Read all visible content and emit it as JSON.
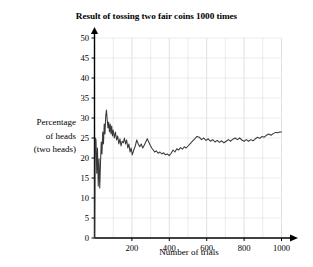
{
  "chart_data": {
    "type": "line",
    "title": "Result of tossing two fair coins 1000 times",
    "xlabel": "Number of trials",
    "ylabel_lines": [
      "Percentage",
      "of heads",
      "(two heads)"
    ],
    "xlim": [
      0,
      1000
    ],
    "ylim": [
      0,
      50
    ],
    "xticks": [
      200,
      400,
      600,
      800,
      1000
    ],
    "yticks": [
      0,
      5,
      10,
      15,
      20,
      25,
      30,
      35,
      40,
      45,
      50
    ],
    "x_minor_step": 100,
    "y_minor_step": 5,
    "grid": true,
    "legend": "none",
    "line_color": "#3a3a3a",
    "grid_color": "#e6e6e6",
    "axis_color": "#000000",
    "series": [
      {
        "name": "Running percentage of two heads",
        "x": [
          1,
          4,
          8,
          12,
          16,
          20,
          24,
          28,
          32,
          36,
          40,
          44,
          48,
          52,
          56,
          60,
          64,
          68,
          72,
          76,
          80,
          84,
          88,
          92,
          96,
          100,
          106,
          112,
          118,
          124,
          130,
          136,
          142,
          148,
          154,
          160,
          166,
          172,
          178,
          184,
          190,
          196,
          202,
          210,
          218,
          226,
          234,
          242,
          250,
          258,
          266,
          274,
          282,
          290,
          298,
          306,
          314,
          322,
          330,
          340,
          350,
          360,
          370,
          380,
          390,
          400,
          410,
          420,
          430,
          440,
          450,
          460,
          470,
          480,
          490,
          500,
          512,
          524,
          536,
          548,
          560,
          572,
          584,
          596,
          608,
          620,
          632,
          644,
          656,
          668,
          680,
          692,
          704,
          716,
          728,
          740,
          752,
          764,
          776,
          788,
          800,
          812,
          824,
          836,
          848,
          860,
          872,
          884,
          896,
          908,
          920,
          932,
          944,
          956,
          968,
          980,
          990,
          1000
        ],
        "y": [
          0,
          25.0,
          24.6,
          16.2,
          22.5,
          13.0,
          19.8,
          12.5,
          18.5,
          24.0,
          21.0,
          26.5,
          23.5,
          28.5,
          26.0,
          30.5,
          32.0,
          29.5,
          27.5,
          29.0,
          26.5,
          28.5,
          26.0,
          28.0,
          25.5,
          27.0,
          25.0,
          26.5,
          24.5,
          25.5,
          23.5,
          24.8,
          23.0,
          24.2,
          23.8,
          25.0,
          23.5,
          24.5,
          22.5,
          23.5,
          21.5,
          22.5,
          20.8,
          22.0,
          23.0,
          24.5,
          23.5,
          22.8,
          23.5,
          22.5,
          23.2,
          24.0,
          24.8,
          24.0,
          23.2,
          22.5,
          22.0,
          21.5,
          21.8,
          21.2,
          21.5,
          21.0,
          21.3,
          20.8,
          21.0,
          20.6,
          21.2,
          22.0,
          21.5,
          22.3,
          22.0,
          22.6,
          22.2,
          22.8,
          22.5,
          23.0,
          23.6,
          24.2,
          24.8,
          25.4,
          25.2,
          24.6,
          25.0,
          24.4,
          24.8,
          24.2,
          24.6,
          24.0,
          24.4,
          23.9,
          24.3,
          23.8,
          24.2,
          24.6,
          24.2,
          24.7,
          25.0,
          24.6,
          25.0,
          24.5,
          24.2,
          24.6,
          24.2,
          24.6,
          24.3,
          24.8,
          25.2,
          24.9,
          25.4,
          25.2,
          25.7,
          26.0,
          25.7,
          26.1,
          26.4,
          26.3,
          26.5,
          26.5
        ]
      }
    ]
  }
}
